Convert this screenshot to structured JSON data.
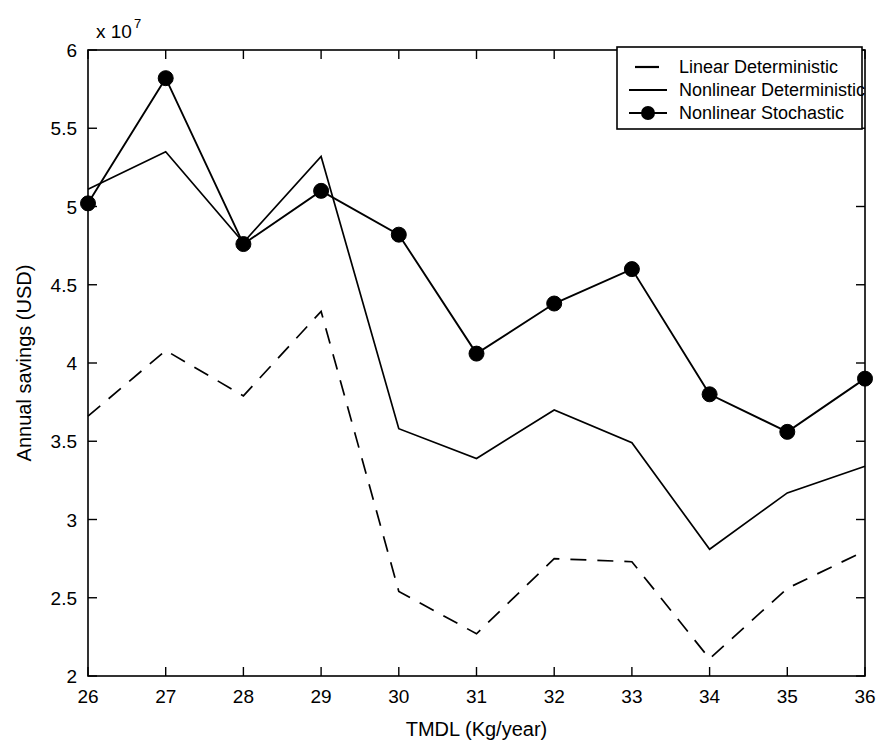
{
  "chart_data": {
    "type": "line",
    "title": "",
    "xlabel": "TMDL (Kg/year)",
    "ylabel": "Annual savings (USD)",
    "y_multiplier_text": "x 10",
    "y_multiplier_exponent": "7",
    "x": [
      26,
      27,
      28,
      29,
      30,
      31,
      32,
      33,
      34,
      35,
      36
    ],
    "xlim": [
      26,
      36
    ],
    "ylim": [
      2,
      6
    ],
    "xticks": [
      "26",
      "27",
      "28",
      "29",
      "30",
      "31",
      "32",
      "33",
      "34",
      "35",
      "36"
    ],
    "yticks": [
      "2",
      "2.5",
      "3",
      "3.5",
      "4",
      "4.5",
      "5",
      "5.5",
      "6"
    ],
    "ytick_values": [
      2,
      2.5,
      3,
      3.5,
      4,
      4.5,
      5,
      5.5,
      6
    ],
    "grid": false,
    "legend_position": "top-right",
    "series": [
      {
        "name": "Linear Deterministic",
        "style": "dashed",
        "marker": "none",
        "color": "#000000",
        "values": [
          3.66,
          4.08,
          3.79,
          4.33,
          2.54,
          2.27,
          2.75,
          2.73,
          2.11,
          2.56,
          2.8
        ]
      },
      {
        "name": "Nonlinear Deterministic",
        "style": "solid",
        "marker": "none",
        "color": "#000000",
        "values": [
          5.11,
          5.35,
          4.77,
          5.32,
          3.58,
          3.39,
          3.7,
          3.49,
          2.81,
          3.17,
          3.34
        ]
      },
      {
        "name": "Nonlinear Stochastic",
        "style": "solid",
        "marker": "circle",
        "color": "#000000",
        "values": [
          5.02,
          5.82,
          4.76,
          5.1,
          4.82,
          4.06,
          4.38,
          4.6,
          3.8,
          3.56,
          3.9
        ]
      }
    ]
  },
  "legend": {
    "entries": [
      {
        "label": "Linear Deterministic"
      },
      {
        "label": "Nonlinear Deterministic"
      },
      {
        "label": "Nonlinear Stochastic"
      }
    ]
  }
}
